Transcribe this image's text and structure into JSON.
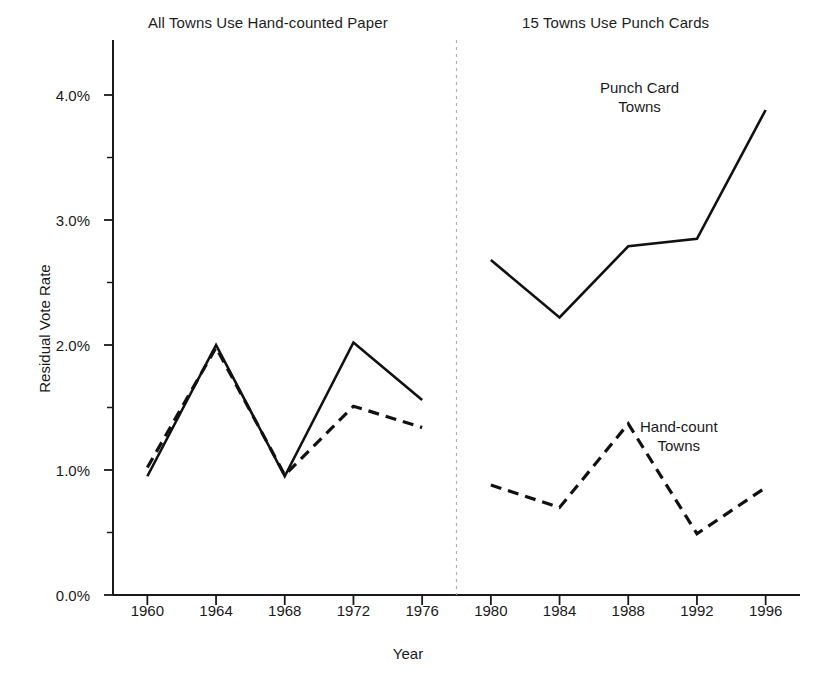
{
  "figure": {
    "panel_title_left": "All Towns Use Hand-counted Paper",
    "panel_title_right": "15 Towns Use Punch Cards",
    "xlabel": "Year",
    "ylabel": "Residual Vote Rate",
    "annotation_punch": "Punch Card",
    "annotation_punch_line2": "Towns",
    "annotation_hand": "Hand-count",
    "annotation_hand_line2": "Towns"
  },
  "chart_data": {
    "type": "line",
    "title": "",
    "subtitle": "",
    "xlabel": "Year",
    "ylabel": "Residual Vote Rate",
    "x": [
      1960,
      1964,
      1968,
      1972,
      1976,
      1980,
      1984,
      1988,
      1992,
      1996
    ],
    "xlim": [
      1958,
      1998
    ],
    "ylim": [
      0.0,
      4.25
    ],
    "ytick_labels": [
      "0.0%",
      "1.0%",
      "2.0%",
      "3.0%",
      "4.0%"
    ],
    "ytick_values": [
      0.0,
      1.0,
      2.0,
      3.0,
      4.0
    ],
    "yminor_values": [
      0.5,
      1.5,
      2.5,
      3.5
    ],
    "xtick_labels": [
      "1960",
      "1964",
      "1968",
      "1972",
      "1976",
      "1980",
      "1984",
      "1988",
      "1992",
      "1996"
    ],
    "grid": false,
    "legend_position": "inline-annotations",
    "divider": {
      "x": 1978,
      "style": "dashed",
      "color": "#b0b0b0"
    },
    "panels": [
      {
        "label": "All Towns Use Hand-counted Paper",
        "x_range": [
          1958,
          1978
        ]
      },
      {
        "label": "15 Towns Use Punch Cards",
        "x_range": [
          1978,
          1998
        ]
      }
    ],
    "series": [
      {
        "name": "Punch Card Towns",
        "style": "solid",
        "color": "#111111",
        "segments": [
          {
            "x": [
              1960,
              1964,
              1968,
              1972,
              1976
            ],
            "values": [
              0.95,
              2.0,
              0.95,
              2.02,
              1.56
            ]
          },
          {
            "x": [
              1980,
              1984,
              1988,
              1992,
              1996
            ],
            "values": [
              2.68,
              2.22,
              2.79,
              2.85,
              3.88
            ]
          }
        ]
      },
      {
        "name": "Hand-count Towns",
        "style": "dashed",
        "color": "#111111",
        "segments": [
          {
            "x": [
              1960,
              1964,
              1968,
              1972,
              1976
            ],
            "values": [
              1.02,
              1.98,
              0.96,
              1.51,
              1.34
            ]
          },
          {
            "x": [
              1980,
              1984,
              1988,
              1992,
              1996
            ],
            "values": [
              0.88,
              0.7,
              1.37,
              0.49,
              0.86
            ]
          }
        ]
      }
    ]
  }
}
